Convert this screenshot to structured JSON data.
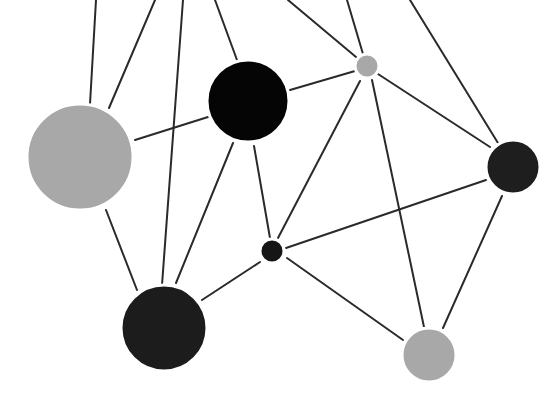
{
  "diagram": {
    "type": "network-graph",
    "width": 546,
    "height": 398,
    "background": "#ffffff",
    "edge_color": "#2a2a2a",
    "edge_width": 2,
    "nodes": [
      {
        "id": "gray-large",
        "cx": 80,
        "cy": 157,
        "r": 53,
        "color": "#a8a8a8"
      },
      {
        "id": "black-top",
        "cx": 248,
        "cy": 101,
        "r": 41,
        "color": "#050505"
      },
      {
        "id": "gray-small-top",
        "cx": 367,
        "cy": 66,
        "r": 12,
        "color": "#a8a8a8"
      },
      {
        "id": "dark-right",
        "cx": 513,
        "cy": 167,
        "r": 27,
        "color": "#1e1e1e"
      },
      {
        "id": "dark-small-center",
        "cx": 272,
        "cy": 251,
        "r": 12,
        "color": "#161616"
      },
      {
        "id": "dark-bottom-left",
        "cx": 164,
        "cy": 328,
        "r": 43,
        "color": "#1c1c1c"
      },
      {
        "id": "gray-bottom-right",
        "cx": 429,
        "cy": 355,
        "r": 27,
        "color": "#a8a8a8"
      }
    ],
    "edges": [
      {
        "x1": 96,
        "y1": 0,
        "x2": 90,
        "y2": 104
      },
      {
        "x1": 155,
        "y1": 0,
        "x2": 109,
        "y2": 108
      },
      {
        "x1": 183,
        "y1": 0,
        "x2": 162,
        "y2": 285
      },
      {
        "x1": 215,
        "y1": 0,
        "x2": 237,
        "y2": 60
      },
      {
        "x1": 288,
        "y1": 0,
        "x2": 356,
        "y2": 57
      },
      {
        "x1": 347,
        "y1": 0,
        "x2": 363,
        "y2": 54
      },
      {
        "x1": 410,
        "y1": 0,
        "x2": 498,
        "y2": 143
      },
      {
        "x1": 135,
        "y1": 140,
        "x2": 208,
        "y2": 117
      },
      {
        "x1": 290,
        "y1": 90,
        "x2": 355,
        "y2": 71
      },
      {
        "x1": 378,
        "y1": 74,
        "x2": 490,
        "y2": 147
      },
      {
        "x1": 360,
        "y1": 81,
        "x2": 278,
        "y2": 238
      },
      {
        "x1": 372,
        "y1": 80,
        "x2": 424,
        "y2": 327
      },
      {
        "x1": 233,
        "y1": 143,
        "x2": 176,
        "y2": 283
      },
      {
        "x1": 254,
        "y1": 146,
        "x2": 270,
        "y2": 238
      },
      {
        "x1": 106,
        "y1": 210,
        "x2": 137,
        "y2": 290
      },
      {
        "x1": 286,
        "y1": 248,
        "x2": 486,
        "y2": 180
      },
      {
        "x1": 260,
        "y1": 262,
        "x2": 202,
        "y2": 300
      },
      {
        "x1": 287,
        "y1": 258,
        "x2": 403,
        "y2": 340
      },
      {
        "x1": 502,
        "y1": 196,
        "x2": 443,
        "y2": 328
      }
    ]
  }
}
